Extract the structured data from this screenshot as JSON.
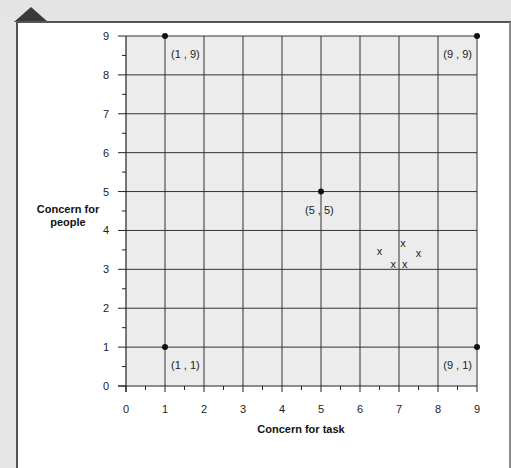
{
  "chart_data": {
    "type": "scatter",
    "title": "",
    "xlabel": "Concern for task",
    "ylabel": "Concern for people",
    "ylabel_lines": [
      "Concern for",
      "people"
    ],
    "xlim": [
      0,
      9
    ],
    "ylim": [
      0,
      9
    ],
    "grid": true,
    "x_ticks": [
      "0",
      "1",
      "2",
      "3",
      "4",
      "5",
      "6",
      "7",
      "8",
      "9"
    ],
    "y_ticks": [
      "0",
      "1",
      "2",
      "3",
      "4",
      "5",
      "6",
      "7",
      "8",
      "9"
    ],
    "labeled_points": [
      {
        "x": 1,
        "y": 9,
        "label": "(1 , 9)"
      },
      {
        "x": 9,
        "y": 9,
        "label": "(9 , 9)"
      },
      {
        "x": 5,
        "y": 5,
        "label": "(5 , 5)"
      },
      {
        "x": 1,
        "y": 1,
        "label": "(1 , 1)"
      },
      {
        "x": 9,
        "y": 1,
        "label": "(9 , 1)"
      }
    ],
    "cross_points": [
      {
        "x": 6.5,
        "y": 3.45,
        "marker": "x"
      },
      {
        "x": 7.1,
        "y": 3.65,
        "marker": "x"
      },
      {
        "x": 7.5,
        "y": 3.4,
        "marker": "x"
      },
      {
        "x": 6.85,
        "y": 3.1,
        "marker": "x"
      },
      {
        "x": 7.15,
        "y": 3.1,
        "marker": "x"
      }
    ],
    "marker_symbol": "x",
    "colors": {
      "grid_bg": "#ececec",
      "grid_line": "#333333",
      "point": "#111111"
    }
  }
}
